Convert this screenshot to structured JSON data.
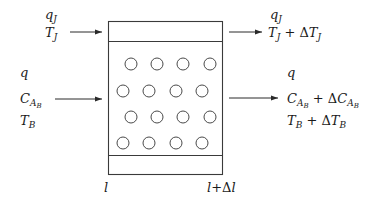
{
  "diagram": {
    "type": "reactor-element-balance",
    "element": {
      "left_boundary_label": "l",
      "right_boundary_label": "l+Δl",
      "has_top_jacket_band": true,
      "has_bottom_jacket_band": true,
      "catalyst_particles": {
        "rows": 4,
        "per_row": 4,
        "shape": "circle"
      }
    },
    "inlet": {
      "jacket": {
        "flow": "q_J",
        "temperature": "T_J"
      },
      "process": {
        "flow": "q",
        "concentration": "C_AB",
        "temperature": "T_B"
      }
    },
    "outlet": {
      "jacket": {
        "flow": "q_J",
        "temperature": "T_J + ΔT_J"
      },
      "process": {
        "flow": "q",
        "concentration": "C_AB + ΔC_AB",
        "temperature": "T_B + ΔT_B"
      }
    },
    "arrows": [
      {
        "from": "inlet-jacket",
        "to": "element"
      },
      {
        "from": "inlet-process",
        "to": "element"
      },
      {
        "from": "element",
        "to": "outlet-jacket"
      },
      {
        "from": "element",
        "to": "outlet-process"
      }
    ]
  },
  "text": {
    "in_qJ_main": "q",
    "in_qJ_sub": "J",
    "in_TJ_main": "T",
    "in_TJ_sub": "J",
    "in_q": "q",
    "in_C_main": "C",
    "in_C_sub": "A",
    "in_C_subsub": "B",
    "in_TB_main": "T",
    "in_TB_sub": "B",
    "out_qJ_main": "q",
    "out_qJ_sub": "J",
    "out_TJ_a": "T",
    "out_TJ_a_sub": "J",
    "out_TJ_op": " + ",
    "out_TJ_delta": "Δ",
    "out_TJ_b": "T",
    "out_TJ_b_sub": "J",
    "out_q": "q",
    "out_C_a": "C",
    "out_C_a_sub": "A",
    "out_C_a_subsub": "B",
    "out_C_op": " + ",
    "out_C_delta": "Δ",
    "out_C_b": "C",
    "out_C_b_sub": "A",
    "out_C_b_subsub": "B",
    "out_TB_a": "T",
    "out_TB_a_sub": "B",
    "out_TB_op": " + ",
    "out_TB_delta": "Δ",
    "out_TB_b": "T",
    "out_TB_b_sub": "B",
    "bound_left": "l",
    "bound_right_a": "l",
    "bound_right_op": "+",
    "bound_right_delta": "Δ",
    "bound_right_b": "l"
  }
}
